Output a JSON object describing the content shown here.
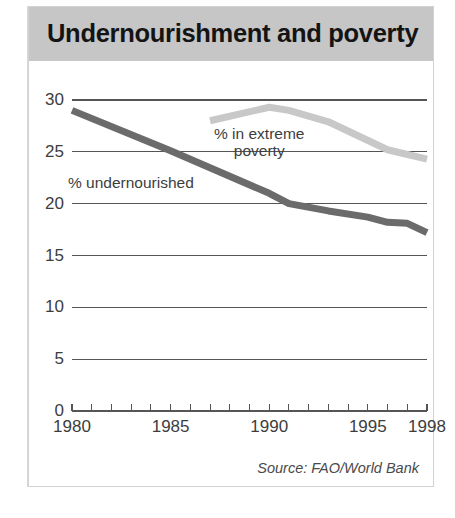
{
  "header": {
    "title": "Undernourishment and poverty"
  },
  "source": {
    "text": "Source: FAO/World Bank"
  },
  "labels": {
    "undernourished": "% undernourished",
    "extreme_poverty_line1": "% in extreme",
    "extreme_poverty_line2": "poverty"
  },
  "colors": {
    "banner": "#c6c6c6",
    "undernourished_line": "#6b6b6b",
    "poverty_line": "#c8c8c8",
    "grid": "#555555",
    "text": "#3d3d3d",
    "title": "#141414"
  },
  "chart_data": {
    "type": "line",
    "title": "Undernourishment and poverty",
    "xlabel": "",
    "ylabel": "",
    "xlim": [
      1980,
      1998
    ],
    "ylim": [
      0,
      30
    ],
    "yticks": [
      0,
      5,
      10,
      15,
      20,
      25,
      30
    ],
    "ytick_labels": [
      "0",
      "5",
      "10",
      "15",
      "20",
      "25",
      "30"
    ],
    "xticks": [
      1980,
      1981,
      1982,
      1983,
      1984,
      1985,
      1986,
      1987,
      1988,
      1989,
      1990,
      1991,
      1992,
      1993,
      1994,
      1995,
      1996,
      1997,
      1998
    ],
    "xtick_labels": [
      "1980",
      "1985",
      "1990",
      "1995",
      "1998"
    ],
    "xtick_labels_at": [
      1980,
      1985,
      1990,
      1995,
      1998
    ],
    "grid": "horizontal",
    "legend": "inline-annotations",
    "series": [
      {
        "name": "% undernourished",
        "color": "#6b6b6b",
        "x": [
          1980,
          1985,
          1990,
          1991,
          1993,
          1995,
          1996,
          1997,
          1998
        ],
        "values": [
          29.0,
          25.1,
          21.0,
          20.0,
          19.3,
          18.7,
          18.2,
          18.1,
          17.2
        ]
      },
      {
        "name": "% in extreme poverty",
        "color": "#c8c8c8",
        "x": [
          1987,
          1990,
          1991,
          1993,
          1996,
          1998
        ],
        "values": [
          28.0,
          29.3,
          29.0,
          27.9,
          25.2,
          24.3
        ]
      }
    ]
  }
}
